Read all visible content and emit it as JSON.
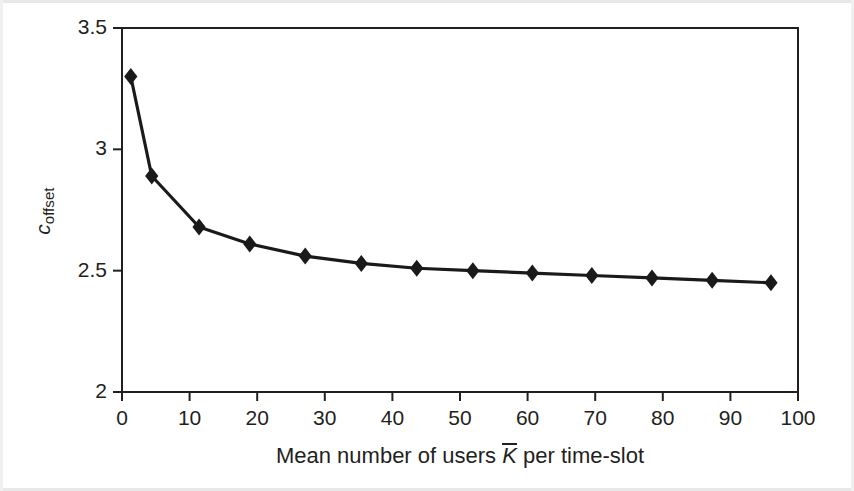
{
  "figure": {
    "background_color": "#ffffff",
    "line_color": "#1a1a1a",
    "marker_shape": "diamond",
    "marker_color": "#1a1a1a",
    "axis_color": "#231f20"
  },
  "axes": {
    "y_label_main": "c",
    "y_label_sub": "offset",
    "x_label_prefix": "Mean number of users ",
    "x_label_var": "K",
    "x_label_suffix": " per time-slot",
    "y_ticks": [
      "3.5",
      "3",
      "2.5",
      "2"
    ],
    "x_ticks": [
      "0",
      "10",
      "20",
      "30",
      "40",
      "50",
      "60",
      "70",
      "80",
      "90",
      "100"
    ]
  },
  "chart_data": {
    "type": "line",
    "title": "",
    "xlabel": "Mean number of users K̄ per time-slot",
    "ylabel": "c_offset",
    "xlim": [
      0,
      100
    ],
    "ylim": [
      2,
      3.5
    ],
    "xticks": [
      0,
      10,
      20,
      30,
      40,
      50,
      60,
      70,
      80,
      90,
      100
    ],
    "yticks": [
      2,
      2.5,
      3,
      3.5
    ],
    "grid": false,
    "legend": false,
    "marker": "diamond",
    "series": [
      {
        "name": "c_offset",
        "x": [
          1.3,
          4.4,
          11.4,
          18.9,
          27.1,
          35.4,
          43.6,
          51.9,
          60.7,
          69.5,
          78.4,
          87.3,
          96.0
        ],
        "y": [
          3.3,
          2.89,
          2.68,
          2.61,
          2.56,
          2.53,
          2.51,
          2.5,
          2.49,
          2.48,
          2.47,
          2.46,
          2.45
        ]
      }
    ]
  }
}
